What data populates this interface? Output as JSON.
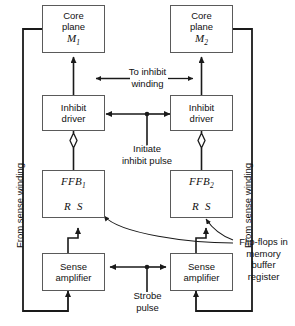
{
  "diagram": {
    "boxes": {
      "core_plane_1": {
        "line1": "Core",
        "line2": "plane",
        "label": "M",
        "sub": "1"
      },
      "core_plane_2": {
        "line1": "Core",
        "line2": "plane",
        "label": "M",
        "sub": "2"
      },
      "inhibit_driver_1": {
        "line1": "Inhibit",
        "line2": "driver"
      },
      "inhibit_driver_2": {
        "line1": "Inhibit",
        "line2": "driver"
      },
      "ffb_1": {
        "name": "FFB",
        "sub": "1",
        "r": "R",
        "s": "S"
      },
      "ffb_2": {
        "name": "FFB",
        "sub": "2",
        "r": "R",
        "s": "S"
      },
      "sense_amplifier_1": {
        "line1": "Sense",
        "line2": "amplifier"
      },
      "sense_amplifier_2": {
        "line1": "Sense",
        "line2": "amplifier"
      }
    },
    "labels": {
      "to_inhibit_winding_l1": "To inhibit",
      "to_inhibit_winding_l2": "winding",
      "initiate_inhibit_l1": "Initiate",
      "initiate_inhibit_l2": "inhibit pulse",
      "strobe_l1": "Strobe",
      "strobe_l2": "pulse",
      "from_sense_winding_left": "From sense winding",
      "from_sense_winding_right": "From sense winding",
      "flipflops_l1": "Flip-flops in",
      "flipflops_l2": "memory",
      "flipflops_l3": "buffer",
      "flipflops_l4": "register"
    },
    "colors": {
      "line": "#1a1a1a",
      "box_border": "#5a5a5a",
      "text": "#111111",
      "background": "#ffffff"
    }
  }
}
